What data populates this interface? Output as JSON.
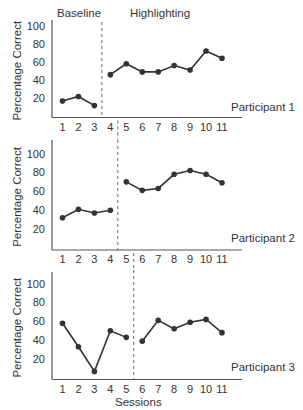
{
  "figure": {
    "phase_labels": {
      "baseline": "Baseline",
      "treatment": "Highlighting"
    },
    "y_axis_label": "Percentage Correct",
    "x_axis_label": "Sessions",
    "y_ticks": [
      "20",
      "40",
      "60",
      "80",
      "100"
    ],
    "x_ticks": [
      "1",
      "2",
      "3",
      "4",
      "5",
      "6",
      "7",
      "8",
      "9",
      "10",
      "11"
    ],
    "colors": {
      "line": "#333333",
      "axis": "#555555",
      "background": "#ffffff"
    }
  },
  "chart_data": [
    {
      "type": "line",
      "title": "Participant 1",
      "xlabel": "",
      "ylabel": "Percentage Correct",
      "ylim": [
        0,
        100
      ],
      "x": [
        1,
        2,
        3,
        4,
        5,
        6,
        7,
        8,
        9,
        10,
        11
      ],
      "phase_change_after_session": 3,
      "series": [
        {
          "name": "Baseline",
          "x": [
            1,
            2,
            3
          ],
          "values": [
            17,
            22,
            12
          ]
        },
        {
          "name": "Highlighting",
          "x": [
            4,
            5,
            6,
            7,
            8,
            9,
            10,
            11
          ],
          "values": [
            46,
            58,
            49,
            49,
            56,
            51,
            72,
            64
          ]
        }
      ],
      "grid": false
    },
    {
      "type": "line",
      "title": "Participant 2",
      "xlabel": "",
      "ylabel": "Percentage Correct",
      "ylim": [
        0,
        100
      ],
      "x": [
        1,
        2,
        3,
        4,
        5,
        6,
        7,
        8,
        9,
        10,
        11
      ],
      "phase_change_after_session": 4,
      "series": [
        {
          "name": "Baseline",
          "x": [
            1,
            2,
            3,
            4
          ],
          "values": [
            32,
            41,
            37,
            40
          ]
        },
        {
          "name": "Highlighting",
          "x": [
            5,
            6,
            7,
            8,
            9,
            10,
            11
          ],
          "values": [
            70,
            61,
            63,
            78,
            82,
            78,
            69
          ]
        }
      ],
      "grid": false
    },
    {
      "type": "line",
      "title": "Participant 3",
      "xlabel": "Sessions",
      "ylabel": "Percentage Correct",
      "ylim": [
        0,
        100
      ],
      "x": [
        1,
        2,
        3,
        4,
        5,
        6,
        7,
        8,
        9,
        10,
        11
      ],
      "phase_change_after_session": 5,
      "series": [
        {
          "name": "Baseline",
          "x": [
            1,
            2,
            3,
            4,
            5
          ],
          "values": [
            58,
            33,
            7,
            50,
            43
          ]
        },
        {
          "name": "Highlighting",
          "x": [
            6,
            7,
            8,
            9,
            10,
            11
          ],
          "values": [
            39,
            61,
            52,
            59,
            62,
            48
          ]
        }
      ],
      "grid": false
    }
  ]
}
